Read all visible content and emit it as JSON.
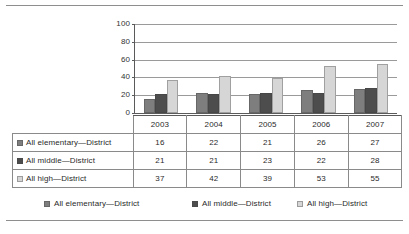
{
  "chart_data": {
    "type": "bar",
    "title": "",
    "subtitle": "",
    "xlabel": "",
    "ylabel": "",
    "categories": [
      "2003",
      "2004",
      "2005",
      "2006",
      "2007"
    ],
    "series": [
      {
        "name": "All elementary—District",
        "values": [
          16,
          22,
          21,
          26,
          27
        ],
        "color": "#7e7e7e"
      },
      {
        "name": "All middle—District",
        "values": [
          21,
          21,
          23,
          22,
          28
        ],
        "color": "#4d4d4d"
      },
      {
        "name": "All high—District",
        "values": [
          37,
          42,
          39,
          53,
          55
        ],
        "color": "#d6d6d6"
      }
    ],
    "ylim": [
      0,
      100
    ],
    "yticks": [
      0,
      20,
      40,
      60,
      80,
      100
    ],
    "ytick_labels": [
      "0",
      "20",
      "40",
      "60",
      "80",
      "100"
    ],
    "grid": true,
    "legend_position": "bottom",
    "annotations": []
  },
  "table": {
    "corner_label": "",
    "column_headers": [
      "2003",
      "2004",
      "2005",
      "2006",
      "2007"
    ],
    "rows": [
      {
        "label": "All elementary—District",
        "color": "#7e7e7e",
        "values": [
          "16",
          "22",
          "21",
          "26",
          "27"
        ]
      },
      {
        "label": "All middle—District",
        "color": "#4d4d4d",
        "values": [
          "21",
          "21",
          "23",
          "22",
          "28"
        ]
      },
      {
        "label": "All high—District",
        "color": "#d6d6d6",
        "values": [
          "37",
          "42",
          "39",
          "53",
          "55"
        ]
      }
    ]
  },
  "legend": {
    "items": [
      {
        "label": "All elementary—District",
        "color": "#7e7e7e"
      },
      {
        "label": "All middle—District",
        "color": "#4d4d4d"
      },
      {
        "label": "All high—District",
        "color": "#d6d6d6"
      }
    ]
  }
}
